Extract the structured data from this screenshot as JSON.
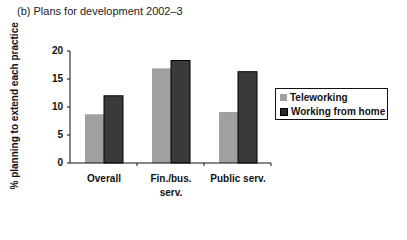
{
  "title": "(b)  Plans for development 2002–3",
  "chart_data": {
    "type": "bar",
    "title": "(b) Plans for development 2002–3",
    "xlabel": "",
    "ylabel": "% planning to extend each practice",
    "ylim": [
      0,
      20
    ],
    "yticks": [
      0,
      5,
      10,
      15,
      20
    ],
    "grid": false,
    "legend_position": "right",
    "categories": [
      "Overall",
      "Fin./bus. serv.",
      "Public serv."
    ],
    "category_lines": [
      [
        "Overall"
      ],
      [
        "Fin./bus.",
        "serv."
      ],
      [
        "Public serv."
      ]
    ],
    "series": [
      {
        "name": "Teleworking",
        "color": "#a0a0a0",
        "values": [
          8.7,
          16.9,
          9.1
        ]
      },
      {
        "name": "Working from home",
        "color": "#3a3a3a",
        "values": [
          12.0,
          18.3,
          16.3
        ]
      }
    ]
  }
}
